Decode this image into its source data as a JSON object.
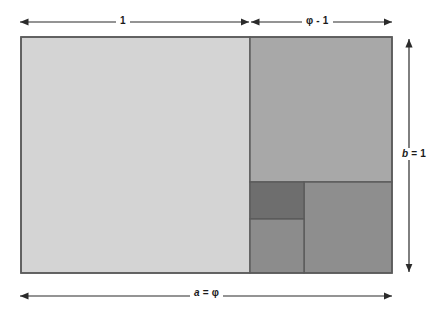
{
  "diagram": {
    "type": "geometric-construction",
    "labels": {
      "top_left": "1",
      "top_right": "φ - 1",
      "right": "b = 1",
      "right_var": "b",
      "right_rest": " = 1",
      "bottom": "a = φ",
      "bottom_var": "a",
      "bottom_rest": " = φ"
    },
    "colors": {
      "square_unit": "#d4d4d4",
      "square_large_right": "#a8a8a8",
      "square_small_dark": "#6e6e6e",
      "square_small_mid": "#8c8c8c",
      "square_bottom_right": "#8e8e8e",
      "stroke": "#5a5a5a",
      "arrow": "#2b2b2b",
      "background": "#ffffff",
      "text": "#1a1a1a"
    },
    "geometry": {
      "outer": {
        "x": 21,
        "y": 37,
        "width": 371,
        "height": 236
      },
      "unit_square": {
        "x": 21,
        "y": 37,
        "width": 229,
        "height": 236
      },
      "right_column": {
        "x": 250,
        "y": 37,
        "width": 142,
        "height": 236
      },
      "square_phi_minus_1": {
        "x": 250,
        "y": 37,
        "width": 142,
        "height": 145
      },
      "lower_strip": {
        "x": 250,
        "y": 182,
        "width": 142,
        "height": 91
      },
      "small_dark": {
        "x": 250,
        "y": 182,
        "width": 54,
        "height": 37
      },
      "small_mid": {
        "x": 250,
        "y": 219,
        "width": 54,
        "height": 54
      },
      "bottom_right": {
        "x": 304,
        "y": 182,
        "width": 88,
        "height": 91
      }
    },
    "arrows": {
      "top_left_segment": {
        "x1": 20,
        "x2": 249,
        "y": 22
      },
      "top_right_segment": {
        "x1": 251,
        "x2": 392,
        "y": 22
      },
      "right_segment": {
        "x": 409,
        "y1": 39,
        "y2": 272
      },
      "bottom_segment": {
        "x1": 20,
        "x2": 392,
        "y": 296
      }
    }
  }
}
